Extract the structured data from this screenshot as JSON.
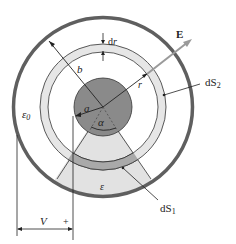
{
  "diagram": {
    "colors": {
      "outer_conductor": "#5f5f5f",
      "inner_conductor": "#8a8a8a",
      "dielectric": "#e2e2e2",
      "shell_ds2": "#e6e6e6",
      "shell_ds1": "#a9a9a9",
      "line": "#222222"
    },
    "labels": {
      "E": "E",
      "dr_d": "d",
      "dr_r": "r",
      "b": "b",
      "r": "r",
      "a": "a",
      "alpha": "α",
      "eps0": "ε",
      "eps0_sub": "0",
      "eps": "ε",
      "dS2_d": "dS",
      "dS2_sub": "2",
      "dS1_d": "dS",
      "dS1_sub": "1",
      "V": "V",
      "plus": "+"
    }
  }
}
